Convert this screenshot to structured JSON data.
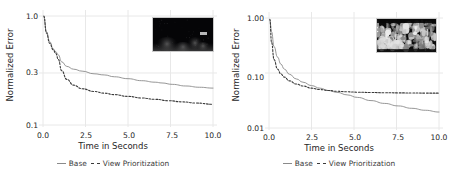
{
  "figure": {
    "layout": "two-panel-row",
    "background": "#ffffff",
    "grid": "vertical-light-gray",
    "grid_color": "#e8e8e8",
    "series_colors": {
      "base": "#8a8a8a",
      "view_prioritization": "#3a3a3a"
    }
  },
  "legend": {
    "items": [
      {
        "label": "Base",
        "style": "solid"
      },
      {
        "label": "View Prioritization",
        "style": "dashed"
      }
    ]
  },
  "chart_data": [
    {
      "type": "line",
      "panel": "left",
      "title": "",
      "xlabel": "Time in Seconds",
      "ylabel": "Normalized Error",
      "xlim": [
        0.0,
        10.0
      ],
      "ylim": [
        0.1,
        1.0
      ],
      "yscale": "log",
      "xticks": [
        "0.0",
        "2.5",
        "5.0",
        "7.5",
        "10.0"
      ],
      "xtick_values": [
        0.0,
        2.5,
        5.0,
        7.5,
        10.0
      ],
      "yticks": [
        "1.0",
        "0.3",
        "0.1"
      ],
      "ytick_values": [
        1.0,
        0.3,
        0.1
      ],
      "grid": true,
      "legend_position": "below",
      "series": [
        {
          "name": "Base",
          "style": "solid",
          "color": "#8a8a8a",
          "x": [
            0.05,
            0.2,
            0.4,
            0.6,
            0.75,
            0.9,
            1.1,
            1.4,
            1.8,
            2.3,
            3.0,
            3.6,
            4.2,
            5.0,
            5.8,
            6.6,
            7.0,
            7.6,
            8.4,
            9.2,
            10.0
          ],
          "y": [
            1.0,
            0.72,
            0.58,
            0.5,
            0.47,
            0.44,
            0.38,
            0.345,
            0.325,
            0.312,
            0.295,
            0.288,
            0.277,
            0.266,
            0.255,
            0.247,
            0.243,
            0.236,
            0.228,
            0.222,
            0.218
          ]
        },
        {
          "name": "View Prioritization",
          "style": "dashed",
          "color": "#3a3a3a",
          "x": [
            0.05,
            0.2,
            0.4,
            0.6,
            0.75,
            0.9,
            1.1,
            1.4,
            1.8,
            2.3,
            3.0,
            3.6,
            4.2,
            5.0,
            5.8,
            6.6,
            7.4,
            8.2,
            9.0,
            10.0
          ],
          "y": [
            1.0,
            0.7,
            0.56,
            0.49,
            0.455,
            0.4,
            0.315,
            0.262,
            0.232,
            0.215,
            0.203,
            0.196,
            0.19,
            0.183,
            0.177,
            0.172,
            0.167,
            0.163,
            0.159,
            0.155
          ]
        }
      ],
      "inset": {
        "description": "dark night scene thumbnail",
        "kind": "image-thumbnail-dark"
      }
    },
    {
      "type": "line",
      "panel": "right",
      "title": "",
      "xlabel": "Time in Seconds",
      "ylabel": "Normalized Error",
      "xlim": [
        0.0,
        10.0
      ],
      "ylim": [
        0.01,
        1.0
      ],
      "yscale": "log",
      "xticks": [
        "0.0",
        "2.5",
        "5.0",
        "7.5",
        "10.0"
      ],
      "xtick_values": [
        0.0,
        2.5,
        5.0,
        7.5,
        10.0
      ],
      "yticks": [
        "1.00",
        "0.10",
        "0.01"
      ],
      "ytick_values": [
        1.0,
        0.1,
        0.01
      ],
      "grid": true,
      "legend_position": "below",
      "series": [
        {
          "name": "Base",
          "style": "solid",
          "color": "#8a8a8a",
          "x": [
            0.05,
            0.15,
            0.3,
            0.5,
            0.7,
            0.9,
            1.2,
            1.6,
            2.0,
            2.5,
            3.0,
            3.5,
            4.0,
            4.6,
            5.2,
            6.0,
            6.8,
            7.6,
            8.4,
            9.2,
            10.0
          ],
          "y": [
            0.95,
            0.56,
            0.3,
            0.195,
            0.145,
            0.118,
            0.095,
            0.078,
            0.068,
            0.059,
            0.053,
            0.048,
            0.0445,
            0.04,
            0.036,
            0.0315,
            0.028,
            0.0252,
            0.0228,
            0.021,
            0.0195
          ]
        },
        {
          "name": "View Prioritization",
          "style": "dashed",
          "color": "#3a3a3a",
          "x": [
            0.05,
            0.15,
            0.3,
            0.5,
            0.7,
            0.9,
            1.2,
            1.6,
            2.0,
            2.5,
            3.0,
            3.5,
            4.0,
            4.6,
            5.2,
            6.0,
            6.8,
            7.6,
            8.4,
            9.2,
            10.0
          ],
          "y": [
            0.95,
            0.36,
            0.175,
            0.118,
            0.096,
            0.084,
            0.072,
            0.063,
            0.058,
            0.053,
            0.05,
            0.048,
            0.0465,
            0.0455,
            0.0448,
            0.0442,
            0.0438,
            0.0435,
            0.0433,
            0.0431,
            0.043
          ]
        }
      ],
      "inset": {
        "description": "grayscale crowd scene thumbnail",
        "kind": "image-thumbnail-bright"
      }
    }
  ]
}
